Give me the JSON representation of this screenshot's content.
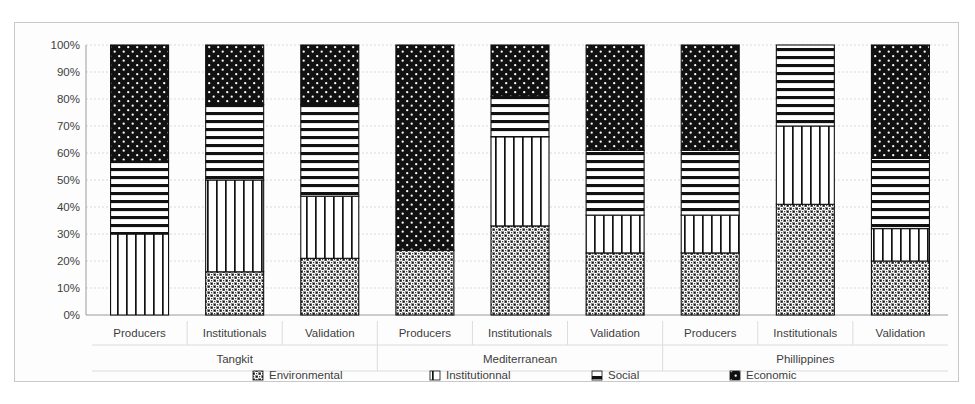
{
  "chart_data": {
    "type": "bar",
    "subtype": "stacked-percentage",
    "title": "",
    "xlabel": "",
    "ylabel": "",
    "ylim": [
      0,
      100
    ],
    "grid": true,
    "legend_position": "bottom",
    "y_tick_labels": [
      "100%",
      "90%",
      "80%",
      "70%",
      "60%",
      "50%",
      "40%",
      "30%",
      "20%",
      "10%",
      "0%"
    ],
    "y_ticks": [
      100,
      90,
      80,
      70,
      60,
      50,
      40,
      30,
      20,
      10,
      0
    ],
    "categories": [
      "Producers",
      "Institutionals",
      "Validation",
      "Producers",
      "Institutionals",
      "Validation",
      "Producers",
      "Institutionals",
      "Validation"
    ],
    "groups": [
      {
        "label": "Tangkit",
        "span": 3
      },
      {
        "label": "Mediterranean",
        "span": 3
      },
      {
        "label": "Phillippines",
        "span": 3
      }
    ],
    "series": [
      {
        "name": "Environmental",
        "pattern": "cross-hatch-dots",
        "values": [
          0,
          16,
          21,
          24,
          33,
          23,
          23,
          41,
          20
        ]
      },
      {
        "name": "Institutionnal",
        "pattern": "vertical-lines",
        "values": [
          30,
          34,
          23,
          0,
          33,
          14,
          14,
          29,
          12
        ]
      },
      {
        "name": "Social",
        "pattern": "horizontal-lines",
        "values": [
          27,
          28,
          34,
          0,
          15,
          24,
          24,
          30,
          26
        ]
      },
      {
        "name": "Economic",
        "pattern": "black-dotted",
        "values": [
          43,
          22,
          22,
          76,
          19,
          39,
          39,
          0,
          42
        ]
      }
    ],
    "cumulative_tops": [
      [
        0,
        30,
        57,
        100
      ],
      [
        16,
        50,
        78,
        100
      ],
      [
        21,
        44,
        78,
        100
      ],
      [
        24,
        24,
        24,
        100
      ],
      [
        33,
        66,
        81,
        100
      ],
      [
        23,
        37,
        61,
        100
      ],
      [
        23,
        37,
        61,
        100
      ],
      [
        41,
        70,
        100,
        100
      ],
      [
        20,
        32,
        58,
        100
      ]
    ]
  },
  "legend": {
    "items": [
      {
        "label": "Environmental",
        "marker": "cross-hatch-dots-swatch"
      },
      {
        "label": "Institutionnal",
        "marker": "vertical-lines-swatch"
      },
      {
        "label": "Social",
        "marker": "horizontal-lines-swatch"
      },
      {
        "label": "Economic",
        "marker": "black-dotted-swatch"
      }
    ]
  },
  "colors": {
    "ink": "#111111",
    "grid": "#d9d9d9",
    "axis": "#9a9a9a",
    "text": "#3d3d3d",
    "background": "#ffffff",
    "frame": "#c9c9c9"
  }
}
